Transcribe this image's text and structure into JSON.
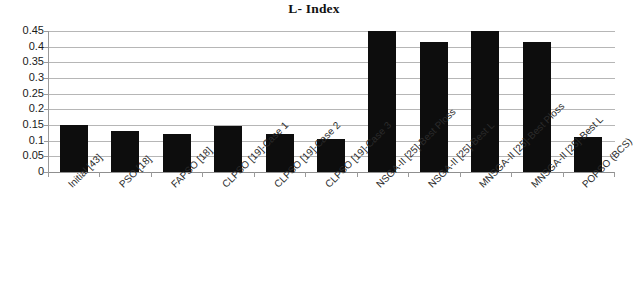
{
  "chart_data": {
    "type": "bar",
    "title": "L- Index",
    "xlabel": "",
    "ylabel": "",
    "ylim": [
      0,
      0.45
    ],
    "yticks": [
      "0",
      "0.05",
      "0.1",
      "0.15",
      "0.2",
      "0.25",
      "0.3",
      "0.35",
      "0.4",
      "0.45"
    ],
    "ytick_values": [
      0,
      0.05,
      0.1,
      0.15,
      0.2,
      0.25,
      0.3,
      0.35,
      0.4,
      0.45
    ],
    "grid": true,
    "legend": "none",
    "bar_color": "#0d0d0d",
    "categories": [
      "Initial [43]",
      "PSO [18]",
      "FAPSO [18]",
      "CLPSO [19]-Case 1",
      "CLPSO [19]-Case 2",
      "CLPSO [19]-Case 3",
      "NSGA-II [25]-Best Ploss",
      "NSGA-II [25]-Best L",
      "MNSGA-II [25]-Best Ploss",
      "MNSGA-II [25]-Best L",
      "POPSO (BCS)"
    ],
    "values": [
      0.15,
      0.13,
      0.12,
      0.148,
      0.122,
      0.105,
      0.45,
      0.415,
      0.45,
      0.415,
      0.113
    ]
  }
}
